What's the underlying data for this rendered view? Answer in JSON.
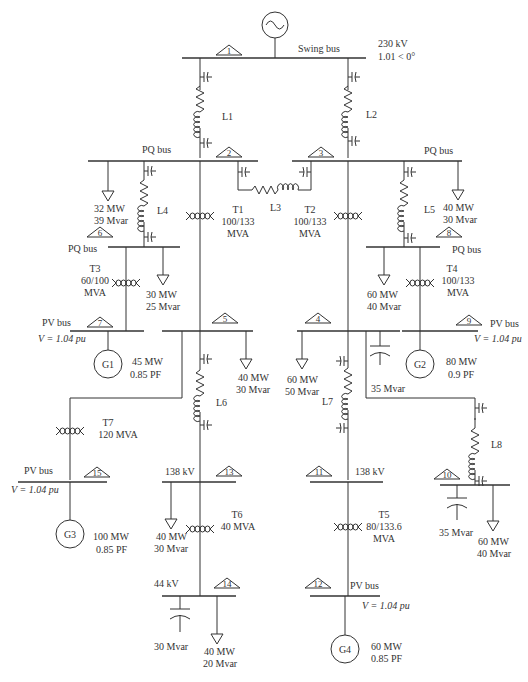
{
  "swing": {
    "label": "Swing bus",
    "voltage": "230 kV",
    "angle": "1.01 < 0°"
  },
  "buses": {
    "b1": "1",
    "b2": "2",
    "b3": "3",
    "b4": "4",
    "b5": "5",
    "b6": "6",
    "b7": "7",
    "b8": "8",
    "b9": "9",
    "b10": "10",
    "b11": "11",
    "b12": "12",
    "b13": "13",
    "b14": "14",
    "b15": "15"
  },
  "bus_types": {
    "b2": "PQ bus",
    "b3": "PQ bus",
    "b6": "PQ bus",
    "b8": "PQ bus",
    "b7": "PV bus",
    "b9": "PV bus",
    "b12": "PV bus",
    "b15": "PV bus",
    "b7_v": "V = 1.04 pu",
    "b9_v": "V = 1.04 pu",
    "b12_v": "V = 1.04 pu",
    "b15_v": "V = 1.04 pu",
    "b13_kv": "138 kV",
    "b11_kv": "138 kV",
    "b14_kv": "44 kV"
  },
  "lines": {
    "L1": "L1",
    "L2": "L2",
    "L3": "L3",
    "L4": "L4",
    "L5": "L5",
    "L6": "L6",
    "L7": "L7",
    "L8": "L8"
  },
  "transformers": {
    "T1": {
      "name": "T1",
      "r1": "100/133",
      "r2": "MVA"
    },
    "T2": {
      "name": "T2",
      "r1": "100/133",
      "r2": "MVA"
    },
    "T3": {
      "name": "T3",
      "r1": "60/100",
      "r2": "MVA"
    },
    "T4": {
      "name": "T4",
      "r1": "100/133",
      "r2": "MVA"
    },
    "T5": {
      "name": "T5",
      "r1": "80/133.6",
      "r2": "MVA"
    },
    "T6": {
      "name": "T6",
      "r1": "40 MVA"
    },
    "T7": {
      "name": "T7",
      "r1": "120 MVA"
    }
  },
  "loads": {
    "ld6": {
      "p": "32 MW",
      "q": "39 Mvar"
    },
    "ld_b6": {
      "p": "30 MW",
      "q": "25 Mvar"
    },
    "ld8": {
      "p": "40 MW",
      "q": "30 Mvar"
    },
    "ld_b8": {
      "p": "60 MW",
      "q": "40 Mvar"
    },
    "ld5": {
      "p": "40 MW",
      "q": "30 Mvar"
    },
    "ld4": {
      "p": "60 MW",
      "q": "50 Mvar"
    },
    "ld13": {
      "p": "40 MW",
      "q": "30 Mvar"
    },
    "ld14": {
      "p": "40 MW",
      "q": "20 Mvar"
    },
    "ld10": {
      "p": "60 MW",
      "q": "40 Mvar"
    }
  },
  "caps": {
    "c4": "35 Mvar",
    "c14": "30 Mvar",
    "c10": "35 Mvar"
  },
  "gens": {
    "G1": {
      "name": "G1",
      "p": "45 MW",
      "pf": "0.85 PF"
    },
    "G2": {
      "name": "G2",
      "p": "80 MW",
      "pf": "0.9 PF"
    },
    "G3": {
      "name": "G3",
      "p": "100 MW",
      "pf": "0.85 PF"
    },
    "G4": {
      "name": "G4",
      "p": "60 MW",
      "pf": "0.85 PF"
    }
  }
}
